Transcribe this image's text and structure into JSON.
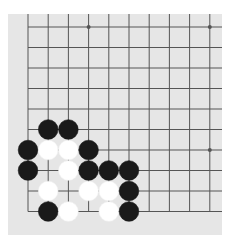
{
  "game": {
    "type": "go",
    "view": "partial board (lower-left corner, 10x10 visible)",
    "colors": {
      "board": "#e6e6e6",
      "grid": "#555555",
      "black": "#1a1a1a",
      "white": "#ffffff"
    },
    "grid": {
      "columns": 10,
      "rows": 10,
      "x_origin": 20,
      "y_origin": 13,
      "x_step": 20.2,
      "y_step": 20.5,
      "open_top": true,
      "open_right": true
    },
    "star_points": [
      {
        "col": 3,
        "row": 0
      },
      {
        "col": 9,
        "row": 0
      },
      {
        "col": 9,
        "row": 6
      }
    ],
    "stones": [
      {
        "color": "black",
        "col": 1,
        "row": 5
      },
      {
        "color": "black",
        "col": 2,
        "row": 5
      },
      {
        "color": "black",
        "col": 0,
        "row": 6
      },
      {
        "color": "white",
        "col": 1,
        "row": 6
      },
      {
        "color": "white",
        "col": 2,
        "row": 6
      },
      {
        "color": "black",
        "col": 3,
        "row": 6
      },
      {
        "color": "black",
        "col": 0,
        "row": 7
      },
      {
        "color": "white",
        "col": 2,
        "row": 7
      },
      {
        "color": "black",
        "col": 3,
        "row": 7
      },
      {
        "color": "black",
        "col": 4,
        "row": 7
      },
      {
        "color": "black",
        "col": 5,
        "row": 7
      },
      {
        "color": "white",
        "col": 1,
        "row": 8
      },
      {
        "color": "white",
        "col": 3,
        "row": 8
      },
      {
        "color": "white",
        "col": 4,
        "row": 8
      },
      {
        "color": "black",
        "col": 5,
        "row": 8
      },
      {
        "color": "black",
        "col": 1,
        "row": 9
      },
      {
        "color": "white",
        "col": 2,
        "row": 9
      },
      {
        "color": "white",
        "col": 4,
        "row": 9
      },
      {
        "color": "black",
        "col": 5,
        "row": 9
      }
    ]
  }
}
